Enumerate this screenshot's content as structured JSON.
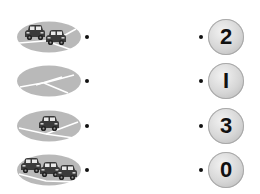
{
  "left_items": [
    {
      "id": "two-cars",
      "cars": 2,
      "icon": "road-two-cars"
    },
    {
      "id": "empty-road",
      "cars": 0,
      "icon": "road-empty"
    },
    {
      "id": "one-car",
      "cars": 1,
      "icon": "road-one-car"
    },
    {
      "id": "three-cars",
      "cars": 3,
      "icon": "road-three-cars"
    }
  ],
  "right_items": [
    {
      "label": "2"
    },
    {
      "label": "I"
    },
    {
      "label": "3"
    },
    {
      "label": "0"
    }
  ],
  "colors": {
    "ellipse": "#b9b9b9",
    "road_line": "#ffffff",
    "car": "#3a3a3a",
    "number_circle": "#d6d6d6",
    "dot": "#111111"
  }
}
